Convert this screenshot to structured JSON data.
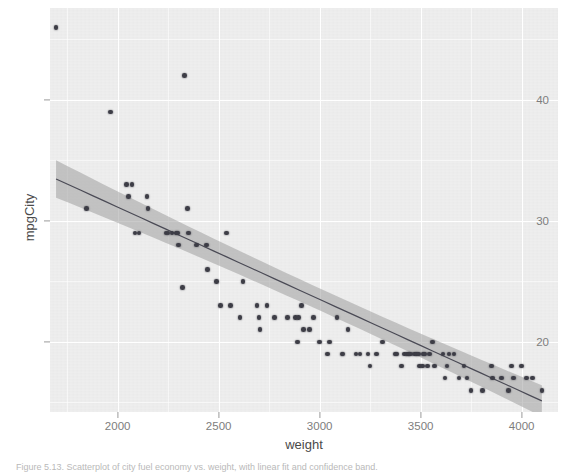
{
  "figure": {
    "background_color": "#ffffff",
    "panel_color": "#ececec",
    "grid_color": "#ffffff",
    "point_color": "#3d3d46",
    "line_color": "#4a4a55",
    "ribbon_color": "#9e9e9e"
  },
  "caption": {
    "text": "Figure 5.13. Scatterplot of city fuel economy vs. weight, with linear fit and confidence band."
  },
  "chart_data": {
    "type": "scatter",
    "title": "",
    "subtitle": "",
    "xlabel": "weight",
    "ylabel": "mpgCity",
    "xlim": [
      1665,
      4180
    ],
    "ylim": [
      14.2,
      47.6
    ],
    "xticks": [
      2000,
      2500,
      3000,
      3500,
      4000
    ],
    "xticklabels": [
      "2000",
      "2500",
      "3000",
      "3500",
      "4000"
    ],
    "yticks": [
      20,
      30,
      40
    ],
    "yticklabels": [
      "20",
      "30",
      "40"
    ],
    "grid": true,
    "grid_minor": true,
    "legend": "none",
    "x": [
      1695,
      1845,
      1965,
      2045,
      2055,
      2070,
      2085,
      2105,
      2145,
      2150,
      2240,
      2250,
      2270,
      2290,
      2295,
      2300,
      2320,
      2330,
      2345,
      2350,
      2390,
      2440,
      2445,
      2490,
      2510,
      2540,
      2560,
      2605,
      2620,
      2690,
      2700,
      2705,
      2740,
      2775,
      2840,
      2880,
      2890,
      2895,
      2910,
      2920,
      2950,
      2970,
      3000,
      3040,
      3050,
      3085,
      3110,
      3115,
      3140,
      3180,
      3200,
      3240,
      3250,
      3280,
      3310,
      3375,
      3380,
      3405,
      3420,
      3435,
      3440,
      3450,
      3470,
      3480,
      3490,
      3495,
      3510,
      3515,
      3520,
      3535,
      3545,
      3560,
      3570,
      3610,
      3620,
      3630,
      3640,
      3665,
      3690,
      3715,
      3730,
      3750,
      3805,
      3850,
      3855,
      3900,
      3935,
      3950,
      3960,
      4000,
      4025,
      4055,
      4100
    ],
    "y": [
      46,
      31,
      39,
      33,
      32,
      33,
      29,
      29,
      32,
      31,
      29,
      29,
      29,
      29,
      29,
      28,
      24.5,
      42,
      31,
      29,
      28,
      28,
      26,
      25,
      23,
      29,
      23,
      22,
      25,
      23,
      22,
      21,
      23,
      22,
      22,
      22,
      20,
      22,
      23,
      21,
      21,
      22,
      20,
      19,
      20,
      22,
      19,
      19,
      21,
      19,
      19,
      19,
      18,
      19,
      20,
      19,
      19,
      18,
      19,
      19,
      19,
      19,
      19,
      19,
      19,
      18,
      18,
      19,
      19,
      18,
      19,
      20,
      18,
      19,
      17,
      18,
      19,
      19,
      17,
      18,
      17,
      16,
      16,
      18,
      17,
      17,
      16,
      18,
      17,
      18,
      17,
      17,
      16
    ],
    "fit": {
      "type": "linear",
      "intercept": 46.4,
      "slope": -0.00763,
      "x_start": 1695,
      "x_end": 4100,
      "y_start": 33.5,
      "y_end": 15.1,
      "confidence_level": 0.95,
      "band_half_width_start": 1.55,
      "band_half_width_mid": 0.42,
      "band_half_width_end": 1.3
    }
  }
}
